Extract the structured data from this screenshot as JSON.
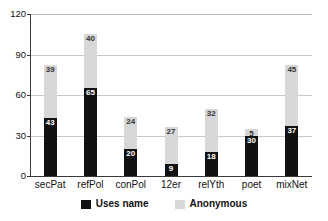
{
  "chart_data": {
    "type": "bar",
    "subtype": "stacked-bar",
    "title": "",
    "xlabel": "",
    "ylabel": "",
    "ylim": [
      0,
      120
    ],
    "yticks": [
      0,
      30,
      60,
      90,
      120
    ],
    "grid": true,
    "legend_position": "bottom-center",
    "categories": [
      "secPat",
      "refPol",
      "conPol",
      "12er",
      "relYth",
      "poet",
      "mixNet"
    ],
    "series": [
      {
        "name": "Uses name",
        "color": "#111111",
        "values": [
          43,
          65,
          20,
          9,
          18,
          30,
          37
        ]
      },
      {
        "name": "Anonymous",
        "color": "#d7d7d7",
        "values": [
          39,
          40,
          24,
          27,
          32,
          5,
          45
        ]
      }
    ],
    "totals": [
      82,
      105,
      44,
      36,
      50,
      35,
      82
    ]
  },
  "axis": {
    "y_tick_labels": [
      "120",
      "90",
      "60",
      "30",
      "0"
    ]
  },
  "legend": {
    "items": [
      {
        "label": "Uses name",
        "swatch": "black-swatch"
      },
      {
        "label": "Anonymous",
        "swatch": "gray-swatch"
      }
    ]
  }
}
